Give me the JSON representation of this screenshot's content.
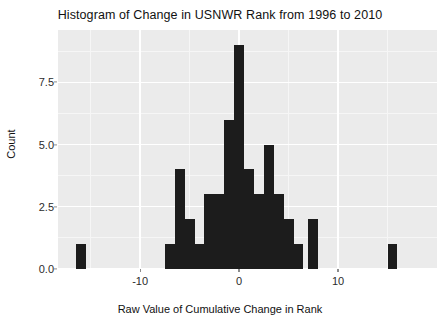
{
  "chart": {
    "title": "Histogram of Change in USNWR Rank from 1996 to 2010",
    "xlabel": "Raw Value of Cumulative Change in Rank",
    "ylabel": "Count"
  },
  "colors": {
    "panel_background": "#ebebeb",
    "grid_major": "#ffffff",
    "grid_minor": "#f6f6f6",
    "bar_fill": "#1c1c1c",
    "text": "#111111",
    "tick_text": "#2b2b2b",
    "figure_background": "#ffffff"
  },
  "axes": {
    "x_ticks": [
      {
        "value": -10,
        "label": "-10"
      },
      {
        "value": 0,
        "label": "0"
      },
      {
        "value": 10,
        "label": "10"
      }
    ],
    "x_minor_ticks": [
      -15,
      -5,
      5,
      15
    ],
    "y_ticks": [
      {
        "value": 0.0,
        "label": "0.0"
      },
      {
        "value": 2.5,
        "label": "2.5"
      },
      {
        "value": 5.0,
        "label": "5.0"
      },
      {
        "value": 7.5,
        "label": "7.5"
      }
    ],
    "y_minor_ticks": [
      1.25,
      3.75,
      6.25,
      8.75
    ],
    "xlim": [
      -18.3,
      20.0
    ],
    "ylim": [
      0,
      9.6
    ]
  },
  "chart_data": {
    "type": "bar",
    "subtype": "histogram",
    "title": "Histogram of Change in USNWR Rank from 1996 to 2010",
    "xlabel": "Raw Value of Cumulative Change in Rank",
    "ylabel": "Count",
    "xlim": [
      -18.3,
      20.0
    ],
    "ylim": [
      0,
      9.6
    ],
    "grid": true,
    "legend": "none",
    "binwidth": 1,
    "bins": [
      {
        "x": -16,
        "count": 1
      },
      {
        "x": -7,
        "count": 1
      },
      {
        "x": -6,
        "count": 4
      },
      {
        "x": -5,
        "count": 2
      },
      {
        "x": -4,
        "count": 1
      },
      {
        "x": -3,
        "count": 3
      },
      {
        "x": -2,
        "count": 3
      },
      {
        "x": -1,
        "count": 6
      },
      {
        "x": 0,
        "count": 9
      },
      {
        "x": 1,
        "count": 4
      },
      {
        "x": 2,
        "count": 3
      },
      {
        "x": 3,
        "count": 5
      },
      {
        "x": 4,
        "count": 3
      },
      {
        "x": 5,
        "count": 2
      },
      {
        "x": 6,
        "count": 1
      },
      {
        "x": 7.5,
        "count": 2
      },
      {
        "x": 15.5,
        "count": 1
      }
    ],
    "categories": [
      "-16",
      "-7",
      "-6",
      "-5",
      "-4",
      "-3",
      "-2",
      "-1",
      "0",
      "1",
      "2",
      "3",
      "4",
      "5",
      "6",
      "7.5",
      "15.5"
    ],
    "values": [
      1,
      1,
      4,
      2,
      1,
      3,
      3,
      6,
      9,
      4,
      3,
      5,
      3,
      2,
      1,
      2,
      1
    ]
  }
}
